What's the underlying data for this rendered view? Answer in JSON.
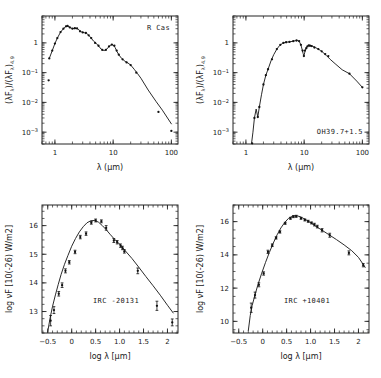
{
  "figure": {
    "title": "",
    "panel_count": 4,
    "background": "#ffffff",
    "ink": "#1a1a1a"
  },
  "chart_data": [
    {
      "id": "panel-top-left",
      "type": "line",
      "title": "",
      "annotation": "R Cas",
      "xlabel": "λ (μm)",
      "ylabel": "(λFλ)/(λFλ)4.9",
      "ylabel_parts": {
        "lead": "(",
        "lambda": "λ",
        "f": "F",
        "fsub": "λ",
        "mid": ")/(",
        "lambda2": "λ",
        "f2": "F",
        "fsub2": "λ",
        "close": ")",
        "subscript": "4.9"
      },
      "xscale": "log",
      "yscale": "log",
      "xlim": [
        0.6,
        130
      ],
      "ylim": [
        0.0004,
        8
      ],
      "xticks": [
        1,
        10,
        100
      ],
      "xticklabels": [
        "1",
        "10",
        "100"
      ],
      "yticks": [
        1,
        0.1,
        0.01,
        0.001
      ],
      "yticklabels": [
        "1",
        "10⁻¹",
        "10⁻²",
        "10⁻³"
      ],
      "grid": false,
      "legend": "none",
      "series": [
        {
          "name": "model",
          "kind": "line",
          "x": [
            0.8,
            0.9,
            1.0,
            1.1,
            1.25,
            1.4,
            1.55,
            1.65,
            1.8,
            2.0,
            2.2,
            2.4,
            2.6,
            2.9,
            3.2,
            3.5,
            3.8,
            4.2,
            4.6,
            5.0,
            5.6,
            6.2,
            7.0,
            7.8,
            8.6,
            9.4,
            10.0,
            10.8,
            11.6,
            12.5,
            14.0,
            16.0,
            18.0,
            20.0,
            23.0,
            26.0,
            30.0,
            40.0,
            55.0,
            70.0,
            100.0
          ],
          "y": [
            0.3,
            0.55,
            0.95,
            1.45,
            2.3,
            3.0,
            3.6,
            3.7,
            3.3,
            3.0,
            3.1,
            3.05,
            2.7,
            2.3,
            2.2,
            2.1,
            1.8,
            1.45,
            1.15,
            1.0,
            0.8,
            0.62,
            0.55,
            0.62,
            0.78,
            0.88,
            0.85,
            0.7,
            0.52,
            0.4,
            0.3,
            0.24,
            0.21,
            0.18,
            0.13,
            0.095,
            0.065,
            0.026,
            0.0105,
            0.0055,
            0.0019
          ]
        },
        {
          "name": "observations",
          "kind": "scatter",
          "x": [
            0.8,
            0.9,
            1.0,
            1.1,
            1.25,
            1.4,
            1.55,
            1.65,
            1.8,
            2.0,
            2.2,
            2.4,
            2.7,
            3.0,
            3.4,
            3.8,
            4.2,
            4.9,
            5.6,
            6.5,
            7.5,
            8.5,
            9.5,
            10.5,
            11.5,
            12.5,
            14.5,
            17.0,
            20.0,
            25.0,
            60.0,
            100.0
          ],
          "y": [
            0.3,
            0.55,
            0.95,
            1.45,
            2.3,
            3.0,
            3.6,
            3.7,
            3.3,
            3.0,
            3.1,
            3.05,
            2.45,
            2.25,
            2.15,
            1.8,
            1.45,
            1.0,
            0.8,
            0.58,
            0.58,
            0.76,
            0.87,
            0.8,
            0.55,
            0.4,
            0.28,
            0.22,
            0.18,
            0.1,
            0.0048,
            0.0011
          ]
        },
        {
          "name": "outlier",
          "kind": "scatter",
          "x": [
            0.78
          ],
          "y": [
            0.055
          ]
        }
      ]
    },
    {
      "id": "panel-top-right",
      "type": "line",
      "title": "",
      "annotation": "OH39.7+1.5",
      "xlabel": "λ (μm)",
      "ylabel": "(λFλ)/(λFλ)4.9",
      "xscale": "log",
      "yscale": "log",
      "xlim": [
        0.6,
        130
      ],
      "ylim": [
        0.0004,
        8
      ],
      "xticks": [
        1,
        10,
        100
      ],
      "xticklabels": [
        "1",
        "10",
        "100"
      ],
      "yticks": [
        1,
        0.1,
        0.01,
        0.001
      ],
      "yticklabels": [
        "1",
        "10⁻¹",
        "10⁻²",
        "10⁻³"
      ],
      "grid": false,
      "legend": "none",
      "series": [
        {
          "name": "model",
          "kind": "line",
          "x": [
            1.25,
            1.32,
            1.4,
            1.5,
            1.6,
            1.7,
            1.85,
            2.0,
            2.2,
            2.4,
            2.7,
            3.0,
            3.4,
            3.8,
            4.3,
            4.9,
            5.5,
            6.2,
            7.0,
            7.8,
            8.4,
            8.8,
            9.2,
            9.6,
            9.9,
            10.2,
            10.6,
            11.0,
            11.6,
            12.3,
            13.0,
            14.0,
            15.5,
            17.0,
            19.0,
            21.0,
            24.0,
            28.0,
            34.0,
            45.0,
            60.0,
            80.0,
            100.0
          ],
          "y": [
            0.00042,
            0.001,
            0.003,
            0.006,
            0.0032,
            0.007,
            0.018,
            0.04,
            0.082,
            0.13,
            0.25,
            0.4,
            0.62,
            0.82,
            0.98,
            1.05,
            1.08,
            1.12,
            1.18,
            1.2,
            1.05,
            0.85,
            0.62,
            0.44,
            0.36,
            0.46,
            0.62,
            0.72,
            0.8,
            0.82,
            0.8,
            0.76,
            0.7,
            0.64,
            0.56,
            0.48,
            0.38,
            0.28,
            0.2,
            0.125,
            0.092,
            0.052,
            0.032
          ]
        },
        {
          "name": "observations",
          "kind": "scatter",
          "x": [
            1.28,
            1.4,
            1.6,
            1.7,
            2.0,
            2.2,
            2.4,
            2.8,
            3.4,
            3.9,
            4.4,
            4.9,
            5.6,
            6.5,
            7.4,
            8.2,
            8.8,
            9.4,
            9.9,
            10.3,
            10.9,
            11.4,
            12.0,
            12.6,
            13.5,
            15.0,
            17.5,
            20.0,
            23.0,
            26.0,
            60.0,
            100.0
          ],
          "y": [
            0.00042,
            0.003,
            0.0032,
            0.007,
            0.04,
            0.082,
            0.13,
            0.28,
            0.62,
            0.86,
            1.0,
            1.05,
            1.08,
            1.14,
            1.2,
            1.15,
            0.86,
            0.55,
            0.36,
            0.55,
            0.66,
            0.76,
            0.82,
            0.8,
            0.78,
            0.7,
            0.62,
            0.52,
            0.42,
            0.36,
            0.092,
            0.032
          ]
        }
      ]
    },
    {
      "id": "panel-bottom-left",
      "type": "line",
      "title": "",
      "annotation": "IRC  -20131",
      "xlabel": "log λ [μm]",
      "ylabel": "log νF [10(-26) W/m2]",
      "xscale": "linear",
      "yscale": "linear",
      "xlim": [
        -0.62,
        2.22
      ],
      "ylim": [
        12.25,
        16.72
      ],
      "xticks": [
        -0.5,
        0,
        0.5,
        1.0,
        1.5,
        2
      ],
      "xticklabels": [
        "−0.5",
        "0",
        "0.5",
        "1.0",
        "1.5",
        "2"
      ],
      "yticks": [
        13,
        14,
        15,
        16
      ],
      "yticklabels": [
        "13",
        "14",
        "15",
        "16"
      ],
      "grid": false,
      "legend": "none",
      "series": [
        {
          "name": "model",
          "kind": "line",
          "x": [
            -0.5,
            -0.45,
            -0.4,
            -0.34,
            -0.28,
            -0.22,
            -0.15,
            -0.08,
            0.0,
            0.08,
            0.16,
            0.24,
            0.32,
            0.4,
            0.48,
            0.56,
            0.64,
            0.72,
            0.8,
            0.88,
            0.96,
            1.04,
            1.14,
            1.26,
            1.4,
            1.55,
            1.7,
            1.85,
            2.0,
            2.12
          ],
          "y": [
            12.3,
            12.78,
            13.18,
            13.58,
            13.95,
            14.3,
            14.65,
            14.95,
            15.28,
            15.55,
            15.78,
            15.96,
            16.1,
            16.17,
            16.18,
            16.12,
            16.0,
            15.86,
            15.7,
            15.55,
            15.42,
            15.28,
            15.08,
            14.85,
            14.55,
            14.22,
            13.9,
            13.57,
            13.22,
            12.95
          ]
        },
        {
          "name": "observations",
          "kind": "scatter",
          "x": [
            -0.44,
            -0.37,
            -0.27,
            -0.2,
            -0.13,
            -0.05,
            0.07,
            0.18,
            0.3,
            0.41,
            0.5,
            0.62,
            0.72,
            0.88,
            0.95,
            1.02,
            1.06,
            1.1,
            1.38,
            1.78,
            2.1
          ],
          "y": [
            12.68,
            13.05,
            13.62,
            13.92,
            14.42,
            14.72,
            15.08,
            15.6,
            15.72,
            16.1,
            16.18,
            16.15,
            15.92,
            15.48,
            15.42,
            15.3,
            15.22,
            15.1,
            14.42,
            13.2,
            12.62
          ],
          "yerr": [
            0.18,
            0.12,
            0.08,
            0.08,
            0.07,
            0.06,
            0.06,
            0.06,
            0.06,
            0.05,
            0.05,
            0.05,
            0.08,
            0.07,
            0.06,
            0.06,
            0.06,
            0.06,
            0.1,
            0.16,
            0.12
          ]
        }
      ]
    },
    {
      "id": "panel-bottom-right",
      "type": "line",
      "title": "",
      "annotation": "IRC  +10401",
      "xlabel": "log λ [μm]",
      "ylabel": "log νF [10(-26) W/m2]",
      "xscale": "linear",
      "yscale": "linear",
      "xlim": [
        -0.62,
        2.22
      ],
      "ylim": [
        9.3,
        17.0
      ],
      "xticks": [
        -0.5,
        0,
        0.5,
        1.0,
        1.5,
        2
      ],
      "xticklabels": [
        "−0.5",
        "0",
        "0.5",
        "1.0",
        "1.5",
        "2"
      ],
      "yticks": [
        10,
        12,
        14,
        16
      ],
      "yticklabels": [
        "10",
        "12",
        "14",
        "16"
      ],
      "grid": false,
      "legend": "none",
      "series": [
        {
          "name": "model",
          "kind": "line",
          "x": [
            -0.3,
            -0.26,
            -0.22,
            -0.16,
            -0.1,
            -0.02,
            0.06,
            0.14,
            0.22,
            0.3,
            0.38,
            0.46,
            0.54,
            0.62,
            0.7,
            0.78,
            0.86,
            0.94,
            1.02,
            1.12,
            1.24,
            1.38,
            1.54,
            1.7,
            1.86,
            2.0,
            2.14
          ],
          "y": [
            9.45,
            10.35,
            10.95,
            11.6,
            12.2,
            12.9,
            13.55,
            14.15,
            14.7,
            15.2,
            15.62,
            15.95,
            16.2,
            16.32,
            16.36,
            16.3,
            16.18,
            16.05,
            15.9,
            15.7,
            15.48,
            15.22,
            14.92,
            14.6,
            14.25,
            13.85,
            13.25
          ]
        },
        {
          "name": "observations",
          "kind": "scatter",
          "x": [
            -0.24,
            -0.16,
            -0.08,
            0.02,
            0.11,
            0.2,
            0.28,
            0.36,
            0.47,
            0.58,
            0.64,
            0.7,
            0.8,
            0.88,
            0.95,
            1.02,
            1.08,
            1.14,
            1.24,
            1.4,
            1.8,
            2.1
          ],
          "y": [
            10.82,
            11.58,
            12.2,
            12.88,
            14.18,
            14.58,
            15.02,
            15.38,
            15.9,
            16.2,
            16.3,
            16.32,
            16.2,
            16.1,
            16.02,
            15.92,
            15.82,
            15.7,
            15.48,
            15.18,
            14.12,
            13.38
          ],
          "yerr": [
            0.28,
            0.18,
            0.12,
            0.1,
            0.1,
            0.08,
            0.07,
            0.07,
            0.06,
            0.06,
            0.06,
            0.06,
            0.06,
            0.06,
            0.06,
            0.06,
            0.08,
            0.08,
            0.1,
            0.12,
            0.12,
            0.1
          ]
        }
      ]
    }
  ]
}
